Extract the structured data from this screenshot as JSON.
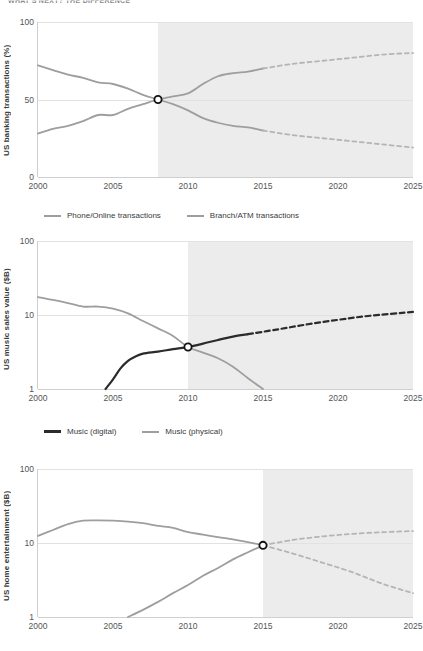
{
  "page": {
    "title": "WHAT'S NEXT?  THE DIFFERENCE",
    "background": "#ffffff",
    "shade_color": "#ececec",
    "grey_line_color": "#9e9e9e",
    "dark_line_color": "#2b2b2b",
    "marker_label": "crossover-point"
  },
  "charts": [
    {
      "id": "banking",
      "type": "line",
      "ylabel": "US banking transactions (%)",
      "xlabel": "",
      "yscale": "linear",
      "yticks": [
        "0",
        "50",
        "100"
      ],
      "ytick_values": [
        0,
        50,
        100
      ],
      "ylim": [
        0,
        100
      ],
      "xticks": [
        "2000",
        "2005",
        "2010",
        "2015",
        "2020",
        "2025"
      ],
      "xtick_values": [
        2000,
        2005,
        2010,
        2015,
        2020,
        2025
      ],
      "xlim": [
        2000,
        2025
      ],
      "forecast_start": 2008,
      "crossover": {
        "x": 2008,
        "y": 50
      },
      "legend": [
        {
          "label": "Phone/Online transactions",
          "color": "#9e9e9e"
        },
        {
          "label": "Branch/ATM transactions",
          "color": "#9e9e9e"
        }
      ],
      "series": [
        {
          "name": "Phone/Online transactions",
          "color": "#9e9e9e",
          "style": "solid",
          "x": [
            2000,
            2001,
            2002,
            2003,
            2004,
            2005,
            2006,
            2007,
            2008,
            2009,
            2010,
            2011,
            2012,
            2013,
            2014,
            2015
          ],
          "y": [
            28,
            31,
            33,
            36,
            40,
            40,
            44,
            47,
            50,
            52,
            54,
            60,
            65,
            67,
            68,
            70
          ]
        },
        {
          "name": "Phone/Online transactions (projected)",
          "color": "#b5b5b5",
          "style": "dashed",
          "x": [
            2015,
            2017,
            2019,
            2021,
            2023,
            2025
          ],
          "y": [
            70,
            73,
            75,
            77,
            79,
            80
          ]
        },
        {
          "name": "Branch/ATM transactions",
          "color": "#9e9e9e",
          "style": "solid",
          "x": [
            2000,
            2001,
            2002,
            2003,
            2004,
            2005,
            2006,
            2007,
            2008,
            2009,
            2010,
            2011,
            2012,
            2013,
            2014,
            2015
          ],
          "y": [
            72,
            69,
            66,
            64,
            61,
            60,
            57,
            53,
            50,
            47,
            43,
            38,
            35,
            33,
            32,
            30
          ]
        },
        {
          "name": "Branch/ATM transactions (projected)",
          "color": "#b5b5b5",
          "style": "dashed",
          "x": [
            2015,
            2017,
            2019,
            2021,
            2023,
            2025
          ],
          "y": [
            30,
            27,
            25,
            23,
            21,
            19
          ]
        }
      ]
    },
    {
      "id": "music",
      "type": "line",
      "ylabel": "US music sales value ($B)",
      "xlabel": "",
      "yscale": "log",
      "yticks": [
        "1",
        "10",
        "100"
      ],
      "ytick_values": [
        1,
        10,
        100
      ],
      "ylim": [
        1,
        100
      ],
      "xticks": [
        "2000",
        "2005",
        "2010",
        "2015",
        "2020",
        "2025"
      ],
      "xtick_values": [
        2000,
        2005,
        2010,
        2015,
        2020,
        2025
      ],
      "xlim": [
        2000,
        2025
      ],
      "forecast_start": 2010,
      "crossover": {
        "x": 2010,
        "y": 3.7
      },
      "legend": [
        {
          "label": "Music (digital)",
          "color": "#2b2b2b"
        },
        {
          "label": "Music (physical)",
          "color": "#9e9e9e"
        }
      ],
      "series": [
        {
          "name": "Music (digital)",
          "color": "#2b2b2b",
          "style": "solid",
          "x": [
            2004.5,
            2005,
            2005.5,
            2006,
            2006.5,
            2007,
            2008,
            2009,
            2010,
            2011,
            2012,
            2013,
            2014
          ],
          "y": [
            1.0,
            1.35,
            1.9,
            2.4,
            2.75,
            3.0,
            3.2,
            3.45,
            3.7,
            4.1,
            4.6,
            5.1,
            5.5
          ]
        },
        {
          "name": "Music (digital) (projected)",
          "color": "#2b2b2b",
          "style": "dashed",
          "x": [
            2014,
            2016,
            2018,
            2020,
            2022,
            2025
          ],
          "y": [
            5.5,
            6.4,
            7.5,
            8.6,
            9.7,
            11.0
          ]
        },
        {
          "name": "Music (physical)",
          "color": "#9e9e9e",
          "style": "solid",
          "x": [
            2000,
            2001,
            2002,
            2003,
            2004,
            2005,
            2006,
            2007,
            2008,
            2009,
            2010,
            2011,
            2012,
            2013,
            2014,
            2015
          ],
          "y": [
            17.5,
            16.0,
            14.5,
            13.0,
            13.0,
            12.2,
            10.5,
            8.3,
            6.6,
            5.2,
            3.7,
            3.1,
            2.6,
            2.0,
            1.4,
            1.0
          ]
        }
      ]
    },
    {
      "id": "home-entertainment",
      "type": "line",
      "ylabel": "US home entertainment ($B)",
      "xlabel": "",
      "yscale": "log",
      "yticks": [
        "1",
        "10",
        "100"
      ],
      "ytick_values": [
        1,
        10,
        100
      ],
      "ylim": [
        1,
        100
      ],
      "xticks": [
        "2000",
        "2005",
        "2010",
        "2015",
        "2020",
        "2025"
      ],
      "xtick_values": [
        2000,
        2005,
        2010,
        2015,
        2020,
        2025
      ],
      "xlim": [
        2000,
        2025
      ],
      "forecast_start": 2015,
      "crossover": {
        "x": 2015,
        "y": 9.3
      },
      "legend": [],
      "series": [
        {
          "name": "Physical (DVD/Blu-ray)",
          "color": "#9e9e9e",
          "style": "solid",
          "x": [
            2000,
            2001,
            2002,
            2003,
            2004,
            2005,
            2006,
            2007,
            2008,
            2009,
            2010,
            2011,
            2012,
            2013,
            2014,
            2015
          ],
          "y": [
            12.5,
            15.0,
            18.0,
            20.0,
            20.2,
            20.0,
            19.5,
            18.5,
            17.0,
            16.0,
            14.0,
            13.0,
            12.0,
            11.2,
            10.3,
            9.3
          ]
        },
        {
          "name": "Physical (DVD/Blu-ray) (projected)",
          "color": "#b5b5b5",
          "style": "dashed",
          "x": [
            2015,
            2017,
            2019,
            2021,
            2023,
            2025
          ],
          "y": [
            9.3,
            7.2,
            5.4,
            4.0,
            2.8,
            2.1
          ]
        },
        {
          "name": "Digital (streaming/download)",
          "color": "#9e9e9e",
          "style": "solid",
          "x": [
            2006,
            2007,
            2008,
            2009,
            2010,
            2011,
            2012,
            2013,
            2014,
            2015
          ],
          "y": [
            1.0,
            1.25,
            1.6,
            2.1,
            2.7,
            3.6,
            4.6,
            6.0,
            7.5,
            9.3
          ]
        },
        {
          "name": "Digital (streaming/download) (projected)",
          "color": "#b5b5b5",
          "style": "dashed",
          "x": [
            2015,
            2017,
            2019,
            2021,
            2023,
            2025
          ],
          "y": [
            9.3,
            11.0,
            12.3,
            13.3,
            14.0,
            14.5
          ]
        }
      ]
    }
  ]
}
